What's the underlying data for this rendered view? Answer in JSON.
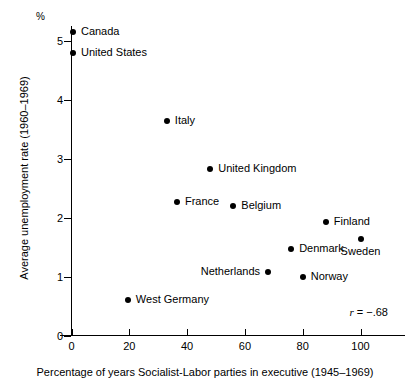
{
  "chart_data": {
    "type": "scatter",
    "title": "",
    "xlabel": "Percentage of years Socialist-Labor parties in executive (1945–1969)",
    "ylabel": "Average unemployment rate (1960–1969)",
    "y_unit_symbol": "%",
    "xlim": [
      -4,
      108
    ],
    "ylim": [
      0,
      5.4
    ],
    "xticks": [
      0,
      20,
      40,
      60,
      80,
      100
    ],
    "xtick_labels": [
      "0",
      "20",
      "40",
      "60",
      "80",
      "100"
    ],
    "yticks": [
      0,
      1,
      2,
      3,
      4,
      5
    ],
    "ytick_labels": [
      "0",
      "1",
      "2",
      "3",
      "4",
      "5"
    ],
    "grid": false,
    "legend": "none",
    "annotation": "r = −.68",
    "annotation_symbol": "r",
    "annotation_value": "= −.68",
    "correlation": -0.68,
    "points": [
      {
        "label": "Canada",
        "x": 0.5,
        "y": 5.15,
        "label_pos": "right"
      },
      {
        "label": "United States",
        "x": 0.5,
        "y": 4.78,
        "label_pos": "right"
      },
      {
        "label": "Italy",
        "x": 33.0,
        "y": 3.63,
        "label_pos": "right"
      },
      {
        "label": "United Kingdom",
        "x": 48.0,
        "y": 2.83,
        "label_pos": "right"
      },
      {
        "label": "France",
        "x": 36.5,
        "y": 2.27,
        "label_pos": "right"
      },
      {
        "label": "Belgium",
        "x": 56.0,
        "y": 2.2,
        "label_pos": "right"
      },
      {
        "label": "Finland",
        "x": 88.0,
        "y": 1.93,
        "label_pos": "right"
      },
      {
        "label": "Sweden",
        "x": 100.0,
        "y": 1.64,
        "label_pos": "below"
      },
      {
        "label": "Denmark",
        "x": 76.0,
        "y": 1.47,
        "label_pos": "right"
      },
      {
        "label": "Netherlands",
        "x": 68.0,
        "y": 1.08,
        "label_pos": "left"
      },
      {
        "label": "Norway",
        "x": 80.0,
        "y": 1.0,
        "label_pos": "right"
      },
      {
        "label": "West Germany",
        "x": 19.5,
        "y": 0.6,
        "label_pos": "right"
      }
    ]
  }
}
